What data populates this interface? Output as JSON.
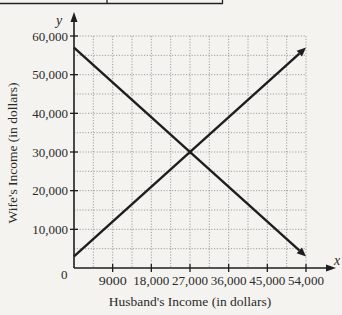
{
  "chart_data": {
    "type": "line",
    "title": "",
    "xlabel": "Husband's Income (in dollars)",
    "ylabel": "Wife's Income (in dollars)",
    "x_axis_var": "x",
    "y_axis_var": "y",
    "xlim": [
      0,
      54000
    ],
    "ylim": [
      0,
      60000
    ],
    "x_ticks": [
      9000,
      18000,
      27000,
      36000,
      45000,
      54000
    ],
    "x_tick_labels": [
      "9000",
      "18,000",
      "27,000",
      "36,000",
      "45,000",
      "54,000"
    ],
    "y_ticks": [
      10000,
      20000,
      30000,
      40000,
      50000,
      60000
    ],
    "y_tick_labels": [
      "10,000",
      "20,000",
      "30,000",
      "40,000",
      "50,000",
      "60,000"
    ],
    "origin_label": "0",
    "grid": true,
    "grid_x_step": 4500,
    "grid_y_step": 5000,
    "legend": null,
    "series": [
      {
        "name": "decreasing line",
        "x": [
          0,
          27000,
          54000
        ],
        "y": [
          57000,
          30000,
          3000
        ],
        "arrow_end": true
      },
      {
        "name": "increasing line",
        "x": [
          0,
          27000,
          54000
        ],
        "y": [
          3000,
          30000,
          57000
        ],
        "arrow_end": true
      }
    ],
    "annotations": [
      {
        "type": "intersection",
        "x": 27000,
        "y": 30000
      }
    ]
  },
  "colors": {
    "background": "#f4f3f0",
    "ink": "#1e1e1e",
    "grid": "#8a8a8a"
  }
}
